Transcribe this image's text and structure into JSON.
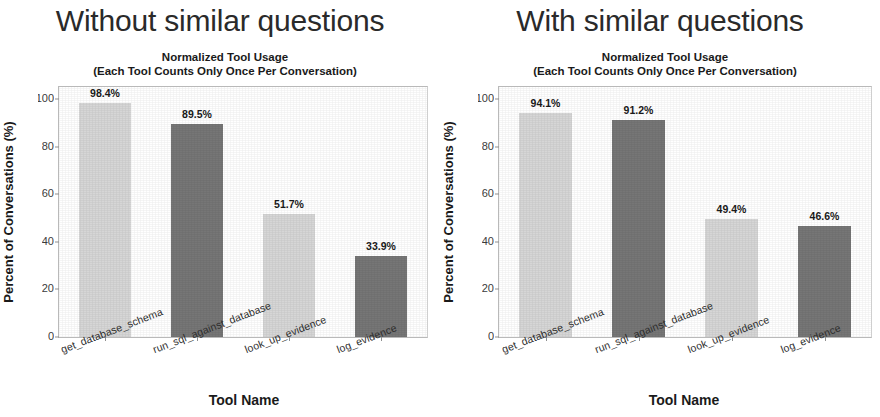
{
  "panels": [
    {
      "heading": "Without similar questions",
      "chart_title_line1": "Normalized Tool Usage",
      "chart_title_line2": "(Each Tool Counts Only Once Per Conversation)",
      "ylabel": "Percent of Conversations (%)",
      "xlabel": "Tool Name",
      "yticks": [
        "100",
        "80",
        "60",
        "40",
        "20",
        "0"
      ],
      "bars": [
        {
          "label": "get_database_schema",
          "value": 98.4,
          "value_label": "98.4%",
          "color": "#d6d6d6"
        },
        {
          "label": "run_sql_against_database",
          "value": 89.5,
          "value_label": "89.5%",
          "color": "#767676"
        },
        {
          "label": "look_up_evidence",
          "value": 51.7,
          "value_label": "51.7%",
          "color": "#d6d6d6"
        },
        {
          "label": "log_evidence",
          "value": 33.9,
          "value_label": "33.9%",
          "color": "#767676"
        }
      ]
    },
    {
      "heading": "With similar questions",
      "chart_title_line1": "Normalized Tool Usage",
      "chart_title_line2": "(Each Tool Counts Only Once Per Conversation)",
      "ylabel": "Percent of Conversations (%)",
      "xlabel": "Tool Name",
      "yticks": [
        "100",
        "80",
        "60",
        "40",
        "20",
        "0"
      ],
      "bars": [
        {
          "label": "get_database_schema",
          "value": 94.1,
          "value_label": "94.1%",
          "color": "#d6d6d6"
        },
        {
          "label": "run_sql_against_database",
          "value": 91.2,
          "value_label": "91.2%",
          "color": "#767676"
        },
        {
          "label": "look_up_evidence",
          "value": 49.4,
          "value_label": "49.4%",
          "color": "#d6d6d6"
        },
        {
          "label": "log_evidence",
          "value": 46.6,
          "value_label": "46.6%",
          "color": "#767676"
        }
      ]
    }
  ],
  "chart_data": [
    {
      "type": "bar",
      "title": "Normalized Tool Usage (Each Tool Counts Only Once Per Conversation)",
      "panel_heading": "Without similar questions",
      "categories": [
        "get_database_schema",
        "run_sql_against_database",
        "look_up_evidence",
        "log_evidence"
      ],
      "values": [
        98.4,
        89.5,
        51.7,
        33.9
      ],
      "data_labels": [
        "98.4%",
        "89.5%",
        "51.7%",
        "33.9%"
      ],
      "xlabel": "Tool Name",
      "ylabel": "Percent of Conversations (%)",
      "ylim": [
        0,
        105
      ],
      "yticks": [
        0,
        20,
        40,
        60,
        80,
        100
      ],
      "bar_colors": [
        "#d6d6d6",
        "#767676",
        "#d6d6d6",
        "#767676"
      ],
      "grid": false,
      "legend": "none"
    },
    {
      "type": "bar",
      "title": "Normalized Tool Usage (Each Tool Counts Only Once Per Conversation)",
      "panel_heading": "With similar questions",
      "categories": [
        "get_database_schema",
        "run_sql_against_database",
        "look_up_evidence",
        "log_evidence"
      ],
      "values": [
        94.1,
        91.2,
        49.4,
        46.6
      ],
      "data_labels": [
        "94.1%",
        "91.2%",
        "49.4%",
        "46.6%"
      ],
      "xlabel": "Tool Name",
      "ylabel": "Percent of Conversations (%)",
      "ylim": [
        0,
        105
      ],
      "yticks": [
        0,
        20,
        40,
        60,
        80,
        100
      ],
      "bar_colors": [
        "#d6d6d6",
        "#767676",
        "#d6d6d6",
        "#767676"
      ],
      "grid": false,
      "legend": "none"
    }
  ]
}
